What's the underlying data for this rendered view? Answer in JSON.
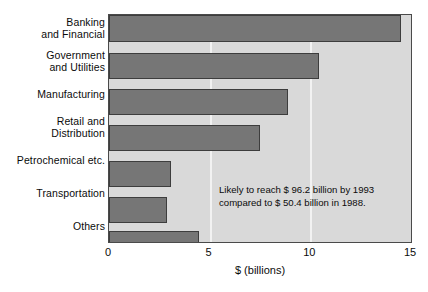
{
  "chart_data": {
    "type": "bar",
    "orientation": "horizontal",
    "title": "",
    "xlabel": "$ (billions)",
    "ylabel": "",
    "categories": [
      "Banking and Financial",
      "Government and Utilities",
      "Manufacturing",
      "Retail and Distribution",
      "Petrochemical etc.",
      "Transportation",
      "Others"
    ],
    "category_lines": [
      [
        "Banking",
        "and Financial"
      ],
      [
        "Government",
        "and Utilities"
      ],
      [
        "Manufacturing"
      ],
      [
        "Retail and",
        "Distribution"
      ],
      [
        "Petrochemical etc."
      ],
      [
        "Transportation"
      ],
      [
        "Others"
      ]
    ],
    "values": [
      14.5,
      10.45,
      8.9,
      7.5,
      3.1,
      2.9,
      4.45
    ],
    "xlim": [
      0,
      15
    ],
    "xticks": [
      0,
      5,
      10,
      15
    ],
    "xtick_labels": [
      "0",
      "5",
      "10",
      "15"
    ],
    "grid": "vertical",
    "legend": "none",
    "annotations": [
      {
        "lines": [
          "Likely to reach $ 96.2  billion by 1993",
          "compared to $ 50.4 billion in 1988."
        ]
      }
    ],
    "colors": {
      "bar_fill": "#767676",
      "bar_edge": "#3d3d3d",
      "plot_background": "#d9d9d9",
      "gridline": "#f2f2f2",
      "axis_border": "#4a4a4a",
      "text": "#0b0b0b",
      "figure_background": "#ffffff"
    }
  }
}
